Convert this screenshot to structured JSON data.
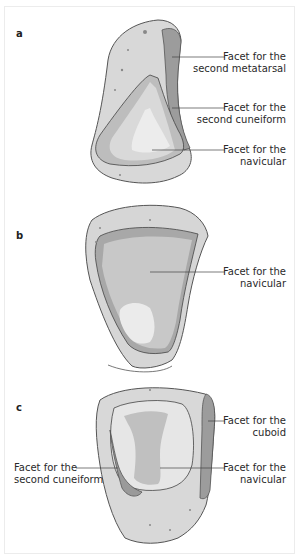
{
  "figure": {
    "panels": [
      {
        "letter": "a",
        "labels": [
          {
            "line1": "Facet for the",
            "line2": "second metatarsal"
          },
          {
            "line1": "Facet for the",
            "line2": "second cuneiform"
          },
          {
            "line1": "Facet for the",
            "line2": "navicular"
          }
        ]
      },
      {
        "letter": "b",
        "labels": [
          {
            "line1": "Facet for the",
            "line2": "navicular"
          }
        ]
      },
      {
        "letter": "c",
        "labels": [
          {
            "line1": "Facet for the",
            "line2": "cuboid"
          },
          {
            "line1": "Facet for the",
            "line2": "second cuneiform"
          },
          {
            "line1": "Facet for the",
            "line2": "navicular"
          }
        ]
      }
    ],
    "colors": {
      "bone": "#d6d6d6",
      "bone_outline": "#555555",
      "facet_dark": "#9a9a9a",
      "facet_mid": "#c0c0c0",
      "facet_light": "#e6e6e6",
      "leader_line": "#444444"
    }
  }
}
